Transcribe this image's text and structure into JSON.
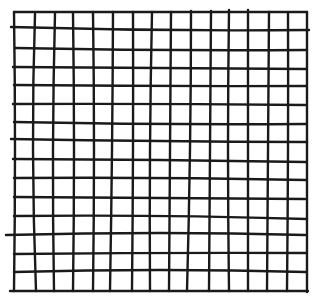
{
  "image": {
    "width": 321,
    "height": 304,
    "background": "#ffffff",
    "description": "Hand-drawn square grid, 16 vertical and 16 horizontal ink lines forming 15x15 cells"
  },
  "grid": {
    "stroke_color": "#1a1a1a",
    "stroke_width": 2.4,
    "rows_of_cells": 15,
    "cols_of_cells": 15,
    "vertical_lines": [
      {
        "top": [
          14,
          12
        ],
        "mid": [
          15,
          150
        ],
        "bottom": [
          14,
          291
        ]
      },
      {
        "top": [
          35,
          14
        ],
        "mid": [
          33,
          150
        ],
        "bottom": [
          36,
          291
        ]
      },
      {
        "top": [
          55,
          13
        ],
        "mid": [
          53,
          150
        ],
        "bottom": [
          54,
          291
        ]
      },
      {
        "top": [
          73,
          13
        ],
        "mid": [
          74,
          150
        ],
        "bottom": [
          73,
          291
        ]
      },
      {
        "top": [
          93,
          12
        ],
        "mid": [
          94,
          150
        ],
        "bottom": [
          93,
          291
        ]
      },
      {
        "top": [
          113,
          12
        ],
        "mid": [
          112,
          150
        ],
        "bottom": [
          110,
          291
        ]
      },
      {
        "top": [
          133,
          12
        ],
        "mid": [
          133,
          150
        ],
        "bottom": [
          132,
          291
        ]
      },
      {
        "top": [
          152,
          12
        ],
        "mid": [
          150,
          150
        ],
        "bottom": [
          150,
          291
        ]
      },
      {
        "top": [
          171,
          12
        ],
        "mid": [
          170,
          150
        ],
        "bottom": [
          169,
          291
        ]
      },
      {
        "top": [
          191,
          11
        ],
        "mid": [
          190,
          150
        ],
        "bottom": [
          187,
          291
        ]
      },
      {
        "top": [
          211,
          11
        ],
        "mid": [
          210,
          150
        ],
        "bottom": [
          209,
          291
        ]
      },
      {
        "top": [
          229,
          10
        ],
        "mid": [
          228,
          150
        ],
        "bottom": [
          229,
          291
        ]
      },
      {
        "top": [
          248,
          10
        ],
        "mid": [
          248,
          150
        ],
        "bottom": [
          248,
          291
        ]
      },
      {
        "top": [
          269,
          12
        ],
        "mid": [
          268,
          150
        ],
        "bottom": [
          267,
          291
        ]
      },
      {
        "top": [
          288,
          13
        ],
        "mid": [
          288,
          150
        ],
        "bottom": [
          287,
          291
        ]
      },
      {
        "top": [
          307,
          12
        ],
        "mid": [
          307,
          150
        ],
        "bottom": [
          307,
          292
        ]
      }
    ],
    "horizontal_lines": [
      {
        "left": [
          14,
          12
        ],
        "mid": [
          160,
          12
        ],
        "right": [
          307,
          12
        ]
      },
      {
        "left": [
          11,
          27
        ],
        "mid": [
          160,
          30
        ],
        "right": [
          309,
          30
        ]
      },
      {
        "left": [
          15,
          48
        ],
        "mid": [
          160,
          50
        ],
        "right": [
          307,
          50
        ]
      },
      {
        "left": [
          13,
          67
        ],
        "mid": [
          160,
          68
        ],
        "right": [
          306,
          69
        ]
      },
      {
        "left": [
          14,
          85
        ],
        "mid": [
          160,
          86
        ],
        "right": [
          306,
          86
        ]
      },
      {
        "left": [
          13,
          104
        ],
        "mid": [
          160,
          104
        ],
        "right": [
          305,
          105
        ]
      },
      {
        "left": [
          14,
          122
        ],
        "mid": [
          160,
          124
        ],
        "right": [
          306,
          124
        ]
      },
      {
        "left": [
          11,
          139
        ],
        "mid": [
          160,
          141
        ],
        "right": [
          307,
          142
        ]
      },
      {
        "left": [
          13,
          159
        ],
        "mid": [
          160,
          160
        ],
        "right": [
          306,
          162
        ]
      },
      {
        "left": [
          14,
          178
        ],
        "mid": [
          160,
          178
        ],
        "right": [
          306,
          180
        ]
      },
      {
        "left": [
          14,
          197
        ],
        "mid": [
          160,
          198
        ],
        "right": [
          305,
          199
        ]
      },
      {
        "left": [
          14,
          216
        ],
        "mid": [
          160,
          216
        ],
        "right": [
          307,
          219
        ]
      },
      {
        "left": [
          6,
          235
        ],
        "mid": [
          160,
          233
        ],
        "right": [
          305,
          235
        ]
      },
      {
        "left": [
          14,
          254
        ],
        "mid": [
          160,
          253
        ],
        "right": [
          306,
          253
        ]
      },
      {
        "left": [
          14,
          272
        ],
        "mid": [
          160,
          270
        ],
        "right": [
          306,
          272
        ]
      },
      {
        "left": [
          10,
          291
        ],
        "mid": [
          160,
          291
        ],
        "right": [
          308,
          291
        ]
      }
    ]
  }
}
